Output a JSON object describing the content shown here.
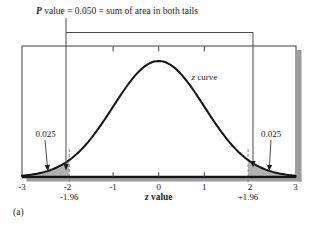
{
  "figure": {
    "title_p": "P",
    "title_rest": " value = 0.050 = sum of area in both tails",
    "curve_label_z": "z",
    "curve_label_rest": " curve",
    "tail_left_label": "0.025",
    "tail_right_label": "0.025",
    "critical_left_label": "-1.96",
    "critical_right_label": "+1.96",
    "axis_label_z": "z",
    "axis_label_rest": " value",
    "panel_label": "(a)"
  },
  "colors": {
    "shade": "#b2b2b2",
    "dash": "#8c8c8c",
    "shadow": "#9c9c9c",
    "curve": "#141414",
    "frame": "#3f3f3f"
  },
  "chart_data": {
    "type": "area",
    "title": "P value = 0.050 = sum of area in both tails",
    "curve": "standard normal (z) density",
    "xlabel": "z value",
    "xlim": [
      -3,
      3
    ],
    "x_ticks": [
      -3,
      -2,
      -1,
      0,
      1,
      2,
      3
    ],
    "inner_ticks": [
      -1,
      0,
      1
    ],
    "critical_values": [
      -1.96,
      1.96
    ],
    "shaded_regions": [
      {
        "from": -3,
        "to": -1.96,
        "area": 0.025
      },
      {
        "from": 1.96,
        "to": 3,
        "area": 0.025
      }
    ],
    "p_value": 0.05,
    "tail_area_labels": [
      "0.025",
      "0.025"
    ],
    "legend_position": "none",
    "grid": false
  }
}
